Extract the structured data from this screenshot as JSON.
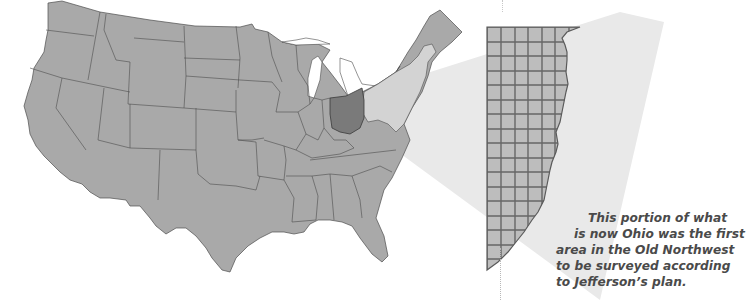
{
  "map": {
    "title": "Contiguous United States with Ohio highlighted",
    "highlighted_state": "Ohio",
    "colors": {
      "states_fill": "#a9a9a9",
      "state_borders": "#4d4d4d",
      "ohio_fill": "#7c7c7c",
      "projection_fill": "#e6e6e6",
      "eastern_states_in_beam": "#d5d5d5",
      "grid_fill": "#bdbdbd",
      "grid_lines": "#6a6a6a",
      "background": "#ffffff"
    }
  },
  "inset": {
    "name": "Seven Ranges survey grid",
    "columns": 6,
    "rows": 16
  },
  "caption": {
    "lines": [
      "This portion of what",
      "is now Ohio was the first",
      "area in the Old Northwest",
      "to be surveyed according",
      "to Jefferson’s plan."
    ]
  }
}
